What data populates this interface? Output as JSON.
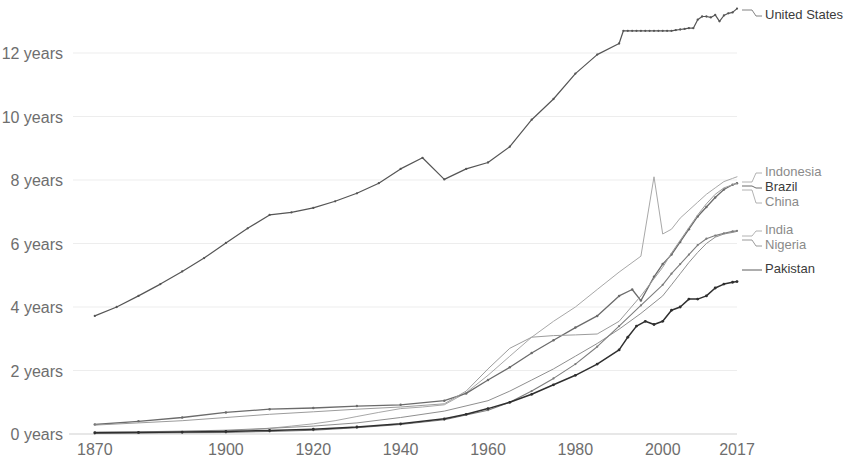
{
  "chart_data": {
    "type": "line",
    "title": "",
    "subtitle": "",
    "xlabel": "",
    "ylabel": "",
    "xlim": [
      1865,
      2017
    ],
    "ylim": [
      0,
      13.8
    ],
    "grid": false,
    "legend_position": "right-inline",
    "y_tick_labels": [
      "0 years",
      "2 years",
      "4 years",
      "6 years",
      "8 years",
      "10 years",
      "12 years"
    ],
    "y_tick_values": [
      0,
      2,
      4,
      6,
      8,
      10,
      12
    ],
    "x_tick_labels": [
      "1870",
      "1900",
      "1920",
      "1940",
      "1960",
      "1980",
      "2000",
      "2017"
    ],
    "x_tick_values": [
      1870,
      1900,
      1920,
      1940,
      1960,
      1980,
      2000,
      2017
    ],
    "series": [
      {
        "name": "United States",
        "color": "#555555",
        "label_color": "#5a5a5a",
        "width": 1.2,
        "marker": true,
        "x": [
          1870,
          1875,
          1880,
          1885,
          1890,
          1895,
          1900,
          1905,
          1910,
          1915,
          1920,
          1925,
          1930,
          1935,
          1940,
          1945,
          1950,
          1955,
          1960,
          1965,
          1970,
          1975,
          1980,
          1985,
          1990,
          1991,
          1992,
          1993,
          1994,
          1995,
          1996,
          1997,
          1998,
          1999,
          2000,
          2001,
          2002,
          2003,
          2004,
          2005,
          2006,
          2007,
          2008,
          2009,
          2010,
          2011,
          2012,
          2013,
          2014,
          2015,
          2016,
          2017
        ],
        "y": [
          3.72,
          4.0,
          4.35,
          4.72,
          5.12,
          5.54,
          6.02,
          6.48,
          6.9,
          6.98,
          7.12,
          7.33,
          7.58,
          7.9,
          8.35,
          8.7,
          8.02,
          8.35,
          8.55,
          9.05,
          9.9,
          10.55,
          11.35,
          11.95,
          12.3,
          12.7,
          12.7,
          12.7,
          12.7,
          12.7,
          12.7,
          12.7,
          12.7,
          12.7,
          12.7,
          12.7,
          12.7,
          12.72,
          12.74,
          12.76,
          12.78,
          12.78,
          13.05,
          13.15,
          13.15,
          13.12,
          13.2,
          13.0,
          13.18,
          13.25,
          13.28,
          13.4
        ]
      },
      {
        "name": "Indonesia",
        "color": "#a8a8a8",
        "label_color": "#9a9a9a",
        "width": 1.0,
        "marker": false,
        "x": [
          1870,
          1880,
          1890,
          1900,
          1905,
          1910,
          1915,
          1920,
          1925,
          1930,
          1935,
          1940,
          1945,
          1950,
          1955,
          1960,
          1965,
          1970,
          1975,
          1980,
          1985,
          1990,
          1995,
          1998,
          2000,
          2002,
          2004,
          2006,
          2008,
          2010,
          2012,
          2014,
          2016,
          2017
        ],
        "y": [
          0.05,
          0.06,
          0.08,
          0.1,
          0.13,
          0.18,
          0.25,
          0.32,
          0.42,
          0.55,
          0.68,
          0.8,
          0.85,
          0.92,
          1.3,
          1.85,
          2.45,
          3.05,
          3.55,
          4.0,
          4.55,
          5.1,
          5.6,
          8.1,
          6.3,
          6.45,
          6.8,
          7.05,
          7.3,
          7.55,
          7.75,
          7.95,
          8.05,
          8.1
        ]
      },
      {
        "name": "Brazil",
        "color": "#6b6b6b",
        "label_color": "#3b3b3b",
        "width": 1.3,
        "marker": true,
        "x": [
          1870,
          1880,
          1890,
          1900,
          1910,
          1920,
          1930,
          1940,
          1950,
          1955,
          1960,
          1965,
          1970,
          1975,
          1980,
          1985,
          1990,
          1993,
          1995,
          1998,
          2000,
          2002,
          2004,
          2006,
          2008,
          2010,
          2012,
          2014,
          2016,
          2017
        ],
        "y": [
          0.3,
          0.4,
          0.52,
          0.68,
          0.78,
          0.82,
          0.88,
          0.92,
          1.05,
          1.28,
          1.7,
          2.1,
          2.55,
          2.95,
          3.35,
          3.72,
          4.35,
          4.55,
          4.2,
          4.95,
          5.35,
          5.65,
          6.05,
          6.45,
          6.85,
          7.15,
          7.45,
          7.7,
          7.85,
          7.9
        ]
      },
      {
        "name": "China",
        "color": "#9c9c9c",
        "label_color": "#9a9a9a",
        "width": 1.0,
        "marker": false,
        "x": [
          1870,
          1880,
          1890,
          1900,
          1910,
          1920,
          1930,
          1940,
          1950,
          1955,
          1960,
          1965,
          1970,
          1975,
          1980,
          1985,
          1990,
          1995,
          2000,
          2002,
          2004,
          2006,
          2008,
          2010,
          2012,
          2014,
          2016,
          2017
        ],
        "y": [
          0.28,
          0.35,
          0.42,
          0.52,
          0.62,
          0.7,
          0.78,
          0.85,
          0.95,
          1.35,
          2.05,
          2.7,
          3.05,
          3.1,
          3.12,
          3.15,
          3.55,
          4.35,
          5.25,
          5.7,
          6.1,
          6.5,
          6.9,
          7.25,
          7.55,
          7.75,
          7.85,
          7.9
        ]
      },
      {
        "name": "India",
        "color": "#8f8f8f",
        "label_color": "#9a9a9a",
        "width": 1.0,
        "marker": false,
        "x": [
          1870,
          1880,
          1890,
          1900,
          1910,
          1920,
          1930,
          1940,
          1950,
          1960,
          1965,
          1970,
          1975,
          1980,
          1985,
          1990,
          1995,
          2000,
          2002,
          2004,
          2006,
          2008,
          2010,
          2012,
          2014,
          2016,
          2017
        ],
        "y": [
          0.06,
          0.07,
          0.09,
          0.12,
          0.18,
          0.25,
          0.35,
          0.52,
          0.72,
          1.05,
          1.35,
          1.7,
          2.05,
          2.45,
          2.85,
          3.3,
          3.8,
          4.35,
          4.7,
          5.05,
          5.4,
          5.72,
          6.0,
          6.2,
          6.3,
          6.35,
          6.38
        ]
      },
      {
        "name": "Nigeria",
        "color": "#7d7d7d",
        "label_color": "#7a7a7a",
        "width": 1.1,
        "marker": true,
        "x": [
          1870,
          1880,
          1890,
          1900,
          1910,
          1920,
          1930,
          1940,
          1950,
          1960,
          1965,
          1970,
          1975,
          1980,
          1985,
          1990,
          1995,
          2000,
          2002,
          2004,
          2006,
          2008,
          2010,
          2012,
          2014,
          2016,
          2017
        ],
        "y": [
          0.02,
          0.03,
          0.04,
          0.05,
          0.08,
          0.12,
          0.2,
          0.3,
          0.45,
          0.75,
          1.0,
          1.35,
          1.75,
          2.2,
          2.75,
          3.4,
          4.05,
          4.7,
          5.05,
          5.35,
          5.65,
          5.95,
          6.15,
          6.25,
          6.32,
          6.38,
          6.4
        ]
      },
      {
        "name": "Pakistan",
        "color": "#2f2f2f",
        "label_color": "#262626",
        "width": 1.5,
        "marker": true,
        "x": [
          1870,
          1880,
          1890,
          1900,
          1910,
          1920,
          1930,
          1940,
          1950,
          1955,
          1960,
          1965,
          1970,
          1975,
          1980,
          1985,
          1990,
          1992,
          1994,
          1996,
          1998,
          2000,
          2002,
          2004,
          2006,
          2008,
          2010,
          2012,
          2014,
          2016,
          2017
        ],
        "y": [
          0.04,
          0.05,
          0.06,
          0.08,
          0.11,
          0.15,
          0.22,
          0.32,
          0.48,
          0.62,
          0.8,
          1.0,
          1.25,
          1.55,
          1.85,
          2.2,
          2.65,
          3.05,
          3.4,
          3.55,
          3.45,
          3.55,
          3.9,
          4.0,
          4.25,
          4.25,
          4.35,
          4.6,
          4.72,
          4.78,
          4.8
        ]
      }
    ],
    "legend_entries": [
      {
        "label": "United States",
        "color": "#5a5a5a",
        "weight": "dark",
        "y": 16,
        "anchor_y": 10
      },
      {
        "label": "Indonesia",
        "color": "#9a9a9a",
        "weight": "mid",
        "y": 173,
        "anchor_y": 182
      },
      {
        "label": "Brazil",
        "color": "#3b3b3b",
        "weight": "dark",
        "y": 188,
        "anchor_y": 186
      },
      {
        "label": "China",
        "color": "#9a9a9a",
        "weight": "mid",
        "y": 203,
        "anchor_y": 190
      },
      {
        "label": "India",
        "color": "#9a9a9a",
        "weight": "mid",
        "y": 231,
        "anchor_y": 236
      },
      {
        "label": "Nigeria",
        "color": "#7a7a7a",
        "weight": "mid",
        "y": 246,
        "anchor_y": 240
      },
      {
        "label": "Pakistan",
        "color": "#262626",
        "weight": "dark",
        "y": 270,
        "anchor_y": 270
      }
    ]
  }
}
